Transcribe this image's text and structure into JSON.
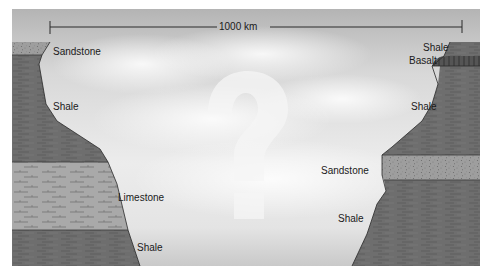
{
  "diagram": {
    "type": "geologic-cross-section",
    "scale_bar": {
      "label": "1000 km"
    },
    "center_symbol": "?",
    "left_column": {
      "layers": [
        {
          "rock": "Sandstone",
          "label": "Sandstone"
        },
        {
          "rock": "Shale",
          "label": "Shale"
        },
        {
          "rock": "Limestone",
          "label": "Limestone"
        },
        {
          "rock": "Shale",
          "label": "Shale"
        }
      ]
    },
    "right_column": {
      "layers": [
        {
          "rock": "Shale",
          "label": "Shale"
        },
        {
          "rock": "Basalt",
          "label": "Basalt"
        },
        {
          "rock": "Shale",
          "label": "Shale"
        },
        {
          "rock": "Sandstone",
          "label": "Sandstone"
        },
        {
          "rock": "Shale",
          "label": "Shale"
        }
      ]
    },
    "colors": {
      "sky_top": "#b8b8b8",
      "sky_bottom": "#e6e6e6",
      "shale": "#6b6b6b",
      "sandstone": "#9c9c9c",
      "limestone": "#a8a8a8",
      "basalt": "#4a4a4a",
      "line": "#2a2a2a"
    }
  }
}
